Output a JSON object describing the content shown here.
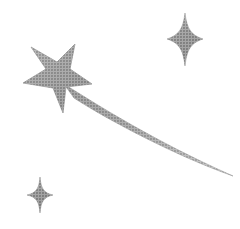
{
  "image": {
    "title": "Shooting Star",
    "description": "Grayscale clipart of a shooting star with a curved tapering trail and two four-pointed sparkles",
    "width": 240,
    "height": 229,
    "background_color": "#ffffff"
  },
  "palette": {
    "background": "#ffffff",
    "fill_light": "#b4b4b4",
    "fill_mid": "#9a9a9a",
    "fill_dark": "#7e7e7e",
    "fill_deep": "#6e6e6e",
    "edge": "#8c8c8c",
    "halftone_dot": "#6a6a6a"
  },
  "elements": {
    "main_star": {
      "name": "five-pointed-star",
      "points": 5,
      "center_x": 62,
      "center_y": 78,
      "bounds": {
        "x": 22,
        "y": 44,
        "width": 70,
        "height": 70
      },
      "path": "M 75 44 L 70 69 L 92 84 L 66 87 L 63 113 L 53 88 L 23 83 L 46 69 L 31 47 L 57 62 Z"
    },
    "trail": {
      "name": "comet-trail",
      "description": "Curved tapering tail sweeping from the star down to the lower right",
      "start_x": 70,
      "start_y": 90,
      "end_x": 233,
      "end_y": 176,
      "path": "M 64 84 C 96 104 152 140 233 176 C 176 156 108 120 74 98 Z"
    },
    "sparkle_top_right": {
      "name": "four-pointed-sparkle",
      "points": 4,
      "center_x": 185,
      "center_y": 39,
      "bounds": {
        "x": 167,
        "y": 13,
        "width": 36,
        "height": 53
      },
      "path": "M 185 13 C 187 29 191 35 203 39 C 191 43 187 49 185 66 C 183 49 179 43 167 39 C 179 35 183 29 185 13 Z"
    },
    "sparkle_bottom_left": {
      "name": "four-pointed-sparkle",
      "points": 4,
      "center_x": 40,
      "center_y": 195,
      "bounds": {
        "x": 27,
        "y": 177,
        "width": 26,
        "height": 36
      },
      "path": "M 40 177 C 41 189 44 193 53 195 C 44 197 41 201 40 213 C 39 201 36 197 27 195 C 36 193 39 189 40 177 Z"
    }
  }
}
